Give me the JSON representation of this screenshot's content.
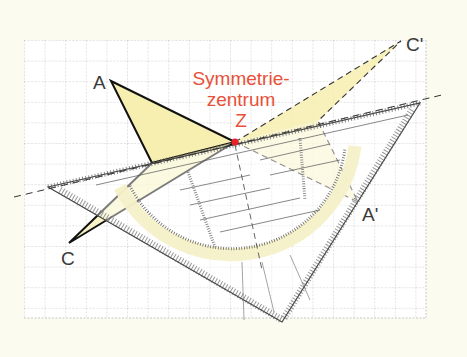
{
  "labels": {
    "A": "A",
    "C": "C",
    "A_prime": "A'",
    "C_prime": "C'",
    "center_line1": "Symmetrie-",
    "center_line2": "zentrum",
    "center_point": "Z"
  },
  "points": {
    "A": [
      111,
      81
    ],
    "B": [
      152,
      163
    ],
    "C": [
      69,
      243
    ],
    "Z": [
      235,
      142
    ],
    "A_prime": [
      358,
      202
    ],
    "B_prime": [
      318,
      121
    ],
    "C_prime": [
      401,
      41
    ]
  },
  "colors": {
    "background": "#fcfbf0",
    "grid": "#bdbdbd",
    "fill_yellow": "#f7efb0",
    "accent_red": "#e8503a",
    "stroke": "#1a1a1a"
  },
  "ruler": {
    "protractor_labels": [
      "10",
      "20",
      "30",
      "40",
      "50",
      "60",
      "70",
      "80",
      "90",
      "100",
      "110",
      "120",
      "130",
      "140",
      "150",
      "160",
      "170"
    ],
    "scale_labels": [
      "1",
      "2",
      "3",
      "4",
      "5",
      "6",
      "7"
    ]
  }
}
